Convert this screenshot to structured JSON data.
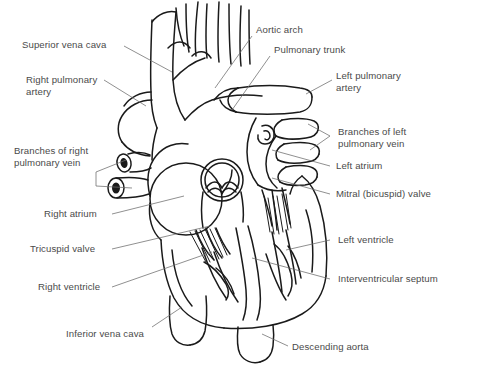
{
  "figure": {
    "background_color": "#ffffff",
    "ink_color": "#1a1a1a",
    "label_color": "#4a4a4a",
    "width": 478,
    "height": 374
  },
  "labels": {
    "superior_vena_cava": "Superior vena cava",
    "right_pulmonary_artery_line1": "Right pulmonary",
    "right_pulmonary_artery_line2": "artery",
    "branches_right_pulmonary_vein_line1": "Branches of right",
    "branches_right_pulmonary_vein_line2": "pulmonary vein",
    "right_atrium": "Right atrium",
    "tricuspid_valve": "Tricuspid valve",
    "right_ventricle": "Right ventricle",
    "inferior_vena_cava": "Inferior vena cava",
    "aortic_arch": "Aortic arch",
    "pulmonary_trunk": "Pulmonary trunk",
    "left_pulmonary_artery_line1": "Left pulmonary",
    "left_pulmonary_artery_line2": "artery",
    "branches_left_pulmonary_vein_line1": "Branches of left",
    "branches_left_pulmonary_vein_line2": "pulmonary vein",
    "left_atrium": "Left atrium",
    "mitral_valve": "Mitral (bicuspid) valve",
    "left_ventricle": "Left ventricle",
    "interventricular_septum": "Interventricular septum",
    "descending_aorta": "Descending aorta"
  },
  "caption": {
    "text": ""
  }
}
